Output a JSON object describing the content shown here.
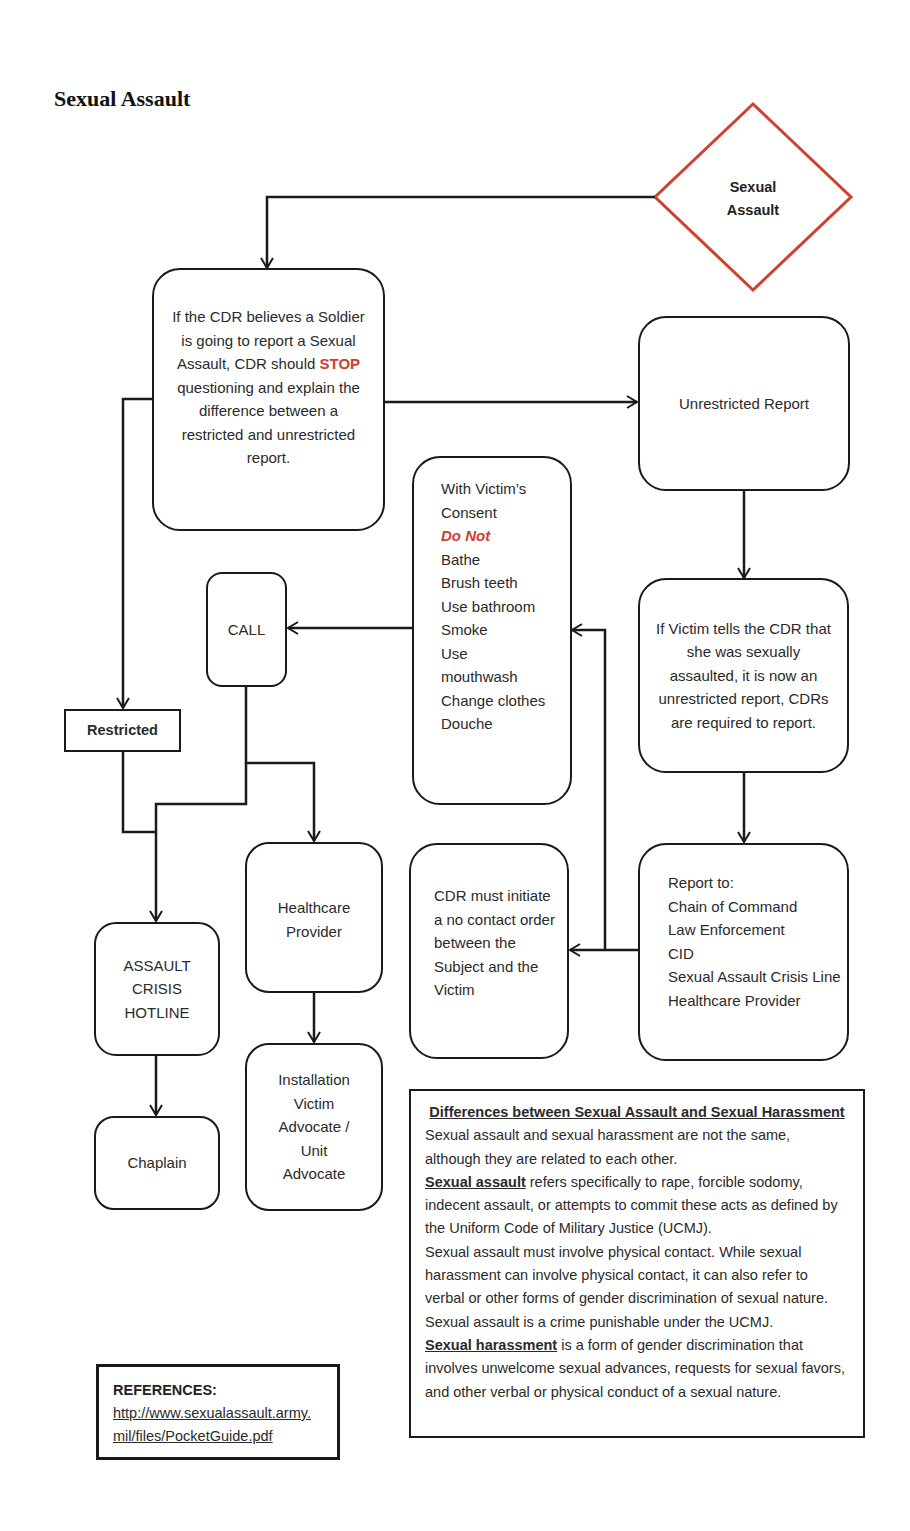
{
  "page": {
    "title": "Sexual Assault"
  },
  "flowchart": {
    "start": {
      "label_line1": "Sexual",
      "label_line2": "Assault",
      "border_color": "#d0402f"
    },
    "cdr_guidance": {
      "before": "If the CDR believes a Soldier is going to report a Sexual Assault, CDR should ",
      "highlight": "STOP",
      "after": " questioning and explain the difference between a restricted and unrestricted report."
    },
    "unrestricted_report": "Unrestricted Report",
    "victim_tells": "If Victim tells the CDR that she was sexually assaulted, it is now an unrestricted report, CDRs are required to report.",
    "report_to": {
      "heading": "Report to:",
      "items": [
        "Chain of Command",
        "Law Enforcement",
        "CID",
        "Sexual Assault Crisis Line",
        "Healthcare Provider"
      ]
    },
    "no_contact": "CDR must initiate a no contact order between the Subject and the Victim",
    "consent": {
      "line1": "With Victim’s",
      "line2": "Consent",
      "warning": "Do Not",
      "items": [
        "Bathe",
        "Brush teeth",
        "Use bathroom",
        "Smoke",
        "Use",
        "mouthwash",
        "Change clothes",
        "Douche"
      ]
    },
    "call": "CALL",
    "restricted": "Restricted",
    "hotline": {
      "line1": "ASSAULT",
      "line2": "CRISIS",
      "line3": "HOTLINE"
    },
    "chaplain": "Chaplain",
    "healthcare": {
      "line1": "Healthcare",
      "line2": "Provider"
    },
    "advocate": {
      "line1": "Installation",
      "line2": "Victim",
      "line3": "Advocate /",
      "line4": "Unit",
      "line5": "Advocate"
    },
    "accent_color": "#d0402f"
  },
  "differences": {
    "heading": "Differences between Sexual Assault and Sexual Harassment",
    "intro": "Sexual assault and sexual harassment are not the same, although they are related to each other.",
    "assault_term": "Sexual assault",
    "assault_def": " refers specifically to rape, forcible sodomy, indecent assault, or attempts to commit these acts as defined by the Uniform Code of Military Justice (UCMJ).",
    "contact_note": "Sexual assault must involve physical contact.  While sexual harassment can involve physical contact, it can also refer to verbal or other forms of gender discrimination of sexual nature.  Sexual assault is a crime punishable under the UCMJ.",
    "harassment_term": "Sexual harassment",
    "harassment_def": " is a form of gender discrimination that involves unwelcome sexual advances, requests for sexual favors, and other verbal or physical conduct of a sexual nature."
  },
  "references": {
    "heading": "REFERENCES:",
    "link": "http://www.sexualassault.army.mil/files/PocketGuide.pdf"
  }
}
